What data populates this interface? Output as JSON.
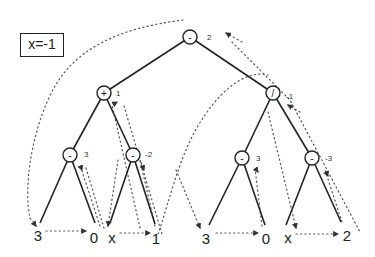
{
  "variable_box": {
    "label": "x=-1"
  },
  "tree": {
    "root": {
      "op": "-",
      "value": "2"
    },
    "left": {
      "op": "+",
      "value": "1"
    },
    "right": {
      "op": "/",
      "value": "-1"
    },
    "left_left": {
      "op": "-",
      "value": "3"
    },
    "left_right": {
      "op": "-",
      "value": "-2"
    },
    "right_left": {
      "op": "-",
      "value": "3"
    },
    "right_right": {
      "op": "-",
      "value": "-3"
    },
    "leaves": [
      "3",
      "0",
      "x",
      "1",
      "3",
      "0",
      "x",
      "2"
    ]
  }
}
